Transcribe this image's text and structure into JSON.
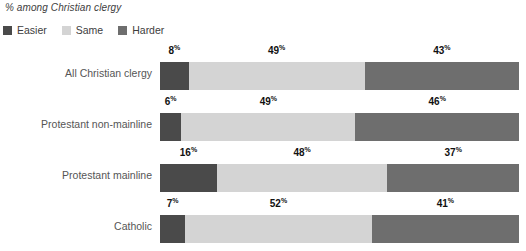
{
  "chart_title": "% among Christian clergy",
  "legend": {
    "items": [
      {
        "label": "Easier",
        "color": "#4a4a4a",
        "key": "easier"
      },
      {
        "label": "Same",
        "color": "#d4d4d4",
        "key": "same"
      },
      {
        "label": "Harder",
        "color": "#6e6e6e",
        "key": "harder"
      }
    ]
  },
  "percent_sign": "%",
  "rows": [
    {
      "label": "All Christian clergy",
      "easier": "8",
      "same": "49",
      "harder": "43"
    },
    {
      "label": "Protestant non-mainline",
      "easier": "6",
      "same": "49",
      "harder": "46"
    },
    {
      "label": "Protestant mainline",
      "easier": "16",
      "same": "48",
      "harder": "37"
    },
    {
      "label": "Catholic",
      "easier": "7",
      "same": "52",
      "harder": "41"
    }
  ],
  "chart_data": {
    "type": "bar",
    "orientation": "horizontal",
    "stacked": true,
    "stacked_100": true,
    "title": "% among Christian clergy",
    "subtitle": "",
    "xlabel": "",
    "ylabel": "",
    "xlim": [
      0,
      100
    ],
    "grid": false,
    "legend_position": "top-left",
    "categories": [
      "All Christian clergy",
      "Protestant non-mainline",
      "Protestant mainline",
      "Catholic"
    ],
    "series": [
      {
        "name": "Easier",
        "color": "#4a4a4a",
        "values": [
          8,
          6,
          16,
          7
        ]
      },
      {
        "name": "Same",
        "color": "#d4d4d4",
        "values": [
          49,
          49,
          48,
          52
        ]
      },
      {
        "name": "Harder",
        "color": "#6e6e6e",
        "values": [
          43,
          46,
          37,
          41
        ]
      }
    ],
    "data_labels": [
      [
        "8%",
        "49%",
        "43%"
      ],
      [
        "6%",
        "49%",
        "46%"
      ],
      [
        "16%",
        "48%",
        "37%"
      ],
      [
        "7%",
        "52%",
        "41%"
      ]
    ]
  }
}
